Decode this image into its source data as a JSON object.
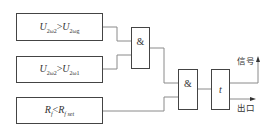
{
  "diagram": {
    "conditions": [
      {
        "var": "U",
        "sub1": "2ω2",
        "op": ">",
        "var2": "U",
        "sub2": "2ωg"
      },
      {
        "var": "U",
        "sub1": "2ω2",
        "op": ">",
        "var2": "U",
        "sub2": "2ω1"
      },
      {
        "var": "R",
        "sub1": "f",
        "op": "<",
        "var2": "R",
        "sub2": "f set"
      }
    ],
    "gates": {
      "and1": "&",
      "and2": "&",
      "timer": "t"
    },
    "outputs": {
      "signal": "信号",
      "exit": "出口"
    },
    "colors": {
      "line": "#888888",
      "box_border": "#444444"
    }
  }
}
